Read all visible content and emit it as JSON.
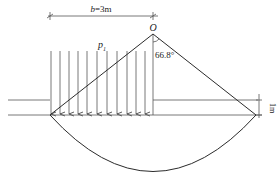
{
  "diagram": {
    "width_label_var": "b",
    "width_label_value": "=3m",
    "apex_label": "O",
    "load_label": "p",
    "load_label_sub": "1",
    "angle_label": "66.8°",
    "depth_label": "1m",
    "arrow_count": 11,
    "colors": {
      "line": "#2b2b2b",
      "background": "#ffffff"
    }
  }
}
